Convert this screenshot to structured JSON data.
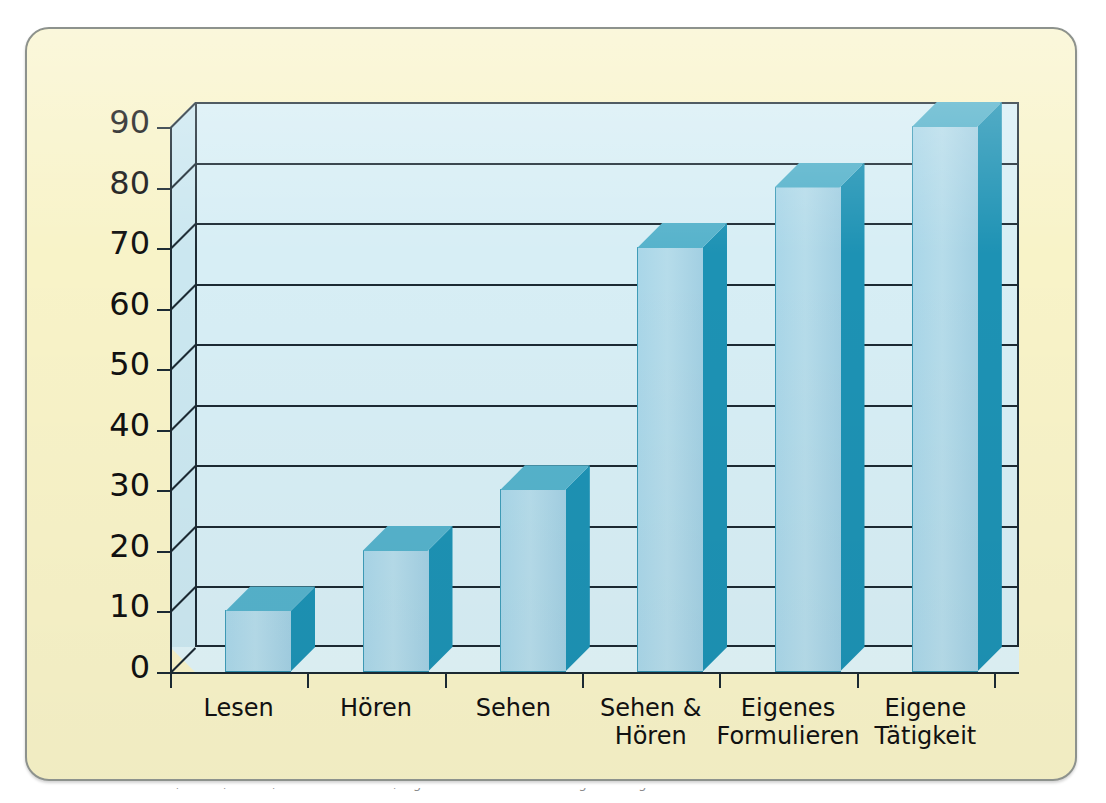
{
  "figure": {
    "card_bg": "#f8f3c8",
    "card_border": "#8d928d",
    "plot_bg": "#d7eef5",
    "bar_front": "#a9d6e8",
    "bar_side": "#1d92b4",
    "bar_top": "#55b2cb",
    "line_color": "#1c2a33",
    "caption_clipped": "Lernen durch Lesen, Hören, Sehen, Sehen und Hören, eigenes Formulieren und eigene Tätigkeit"
  },
  "chart_data": {
    "type": "bar",
    "title": "",
    "subtitle": "",
    "xlabel": "",
    "ylabel": "",
    "ylim": [
      0,
      90
    ],
    "ytick_step": 10,
    "grid": true,
    "legend": false,
    "style": "3d-column",
    "categories": [
      "Lesen",
      "Hören",
      "Sehen",
      "Sehen &\nHören",
      "Eigenes\nFormulieren",
      "Eigene\nTätigkeit"
    ],
    "values": [
      10,
      20,
      30,
      70,
      80,
      90
    ],
    "ytick_labels": [
      "0",
      "10",
      "20",
      "30",
      "40",
      "50",
      "60",
      "70",
      "80",
      "90"
    ],
    "series": [
      {
        "name": "Behaltensquote",
        "values": [
          10,
          20,
          30,
          70,
          80,
          90
        ]
      }
    ]
  }
}
